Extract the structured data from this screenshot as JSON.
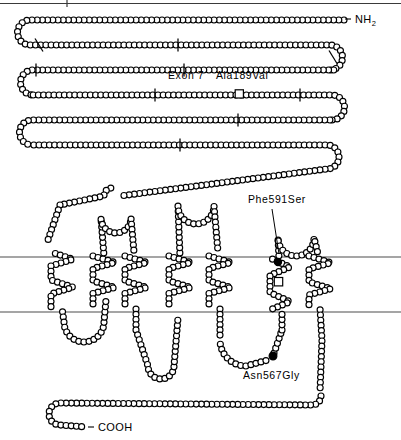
{
  "figure": {
    "background_color": "#ffffff",
    "width": 401,
    "height": 440
  },
  "terminals": {
    "n_terminus": {
      "label": "NH",
      "subscript": "2",
      "dash": "-",
      "x": 352,
      "y": 22
    },
    "c_terminus": {
      "label": "COOH",
      "dash": "-",
      "x": 96,
      "y": 430
    }
  },
  "annotations": [
    {
      "name": "exon-7-label",
      "text": "Exon 7",
      "x": 168,
      "y": 79,
      "marker": "none"
    },
    {
      "name": "ala189val-label",
      "text": "Ala189Val",
      "x": 216,
      "y": 79,
      "marker": "open-square",
      "marker_x": 239,
      "marker_y": 94
    },
    {
      "name": "phe591ser-label",
      "text": "Phe591Ser",
      "x": 248,
      "y": 203,
      "marker": "filled-circle",
      "marker_x": 278,
      "marker_y": 262
    },
    {
      "name": "asn567gly-label",
      "text": "Asn567Gly",
      "x": 243,
      "y": 379,
      "marker": "filled-circle",
      "marker_x": 273,
      "marker_y": 356
    }
  ],
  "membrane": {
    "color": "#4d4d4d",
    "upper_line_y": 257,
    "lower_line_y": 312,
    "x_start": 0,
    "x_end": 401
  },
  "top_rule": {
    "color": "#3a3a3a",
    "y": 3,
    "x_start": 0,
    "x_end": 401,
    "tick_x": 67
  },
  "colors": {
    "bead_fill": "#ffffff",
    "bead_stroke": "#000000",
    "marker_filled": "#000000",
    "membrane": "#4d4d4d",
    "text": "#000000"
  },
  "bead_style": {
    "radius": 3.0,
    "spacing": 5.2
  }
}
